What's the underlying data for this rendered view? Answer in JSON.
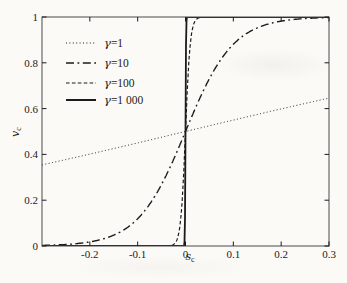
{
  "figure": {
    "background": "#fbfaf7",
    "ink": "#1b1b1b",
    "frame_color": "#4a4a4a"
  },
  "chart_data": {
    "type": "line",
    "title": "",
    "xlabel": "s_c",
    "ylabel": "v_c",
    "xlim": [
      -0.3,
      0.3
    ],
    "ylim": [
      0,
      1
    ],
    "x_ticks": [
      -0.2,
      -0.1,
      0,
      0.1,
      0.2,
      0.3
    ],
    "x_tick_labels": [
      "-0.2",
      "-0.1",
      "0",
      "0.1",
      "0.2",
      "0.3"
    ],
    "y_ticks": [
      0,
      0.2,
      0.4,
      0.6,
      0.8,
      1
    ],
    "y_tick_labels": [
      "0",
      "0.2",
      "0.4",
      "0.6",
      "0.8",
      "1"
    ],
    "grid": false,
    "legend": {
      "position": "upper-left-inside",
      "border": false
    },
    "function": "v_c = 1 / (1 + exp(-2 * gamma * s_c))",
    "series": [
      {
        "name": "γ=1",
        "symbol": "γ",
        "value_label": "=1",
        "gamma": 1,
        "style": "dotted",
        "color": "#1b1b1b",
        "points": [
          [
            -0.3,
            0.354
          ],
          [
            -0.2,
            0.401
          ],
          [
            -0.1,
            0.45
          ],
          [
            0,
            0.5
          ],
          [
            0.1,
            0.55
          ],
          [
            0.2,
            0.599
          ],
          [
            0.3,
            0.646
          ]
        ]
      },
      {
        "name": "γ=10",
        "symbol": "γ",
        "value_label": "=10",
        "gamma": 10,
        "style": "dash-dot",
        "color": "#1b1b1b",
        "points": [
          [
            -0.3,
            0.002
          ],
          [
            -0.2,
            0.018
          ],
          [
            -0.15,
            0.047
          ],
          [
            -0.1,
            0.119
          ],
          [
            -0.05,
            0.269
          ],
          [
            0,
            0.5
          ],
          [
            0.05,
            0.731
          ],
          [
            0.1,
            0.881
          ],
          [
            0.15,
            0.953
          ],
          [
            0.2,
            0.982
          ],
          [
            0.25,
            0.993
          ],
          [
            0.3,
            0.998
          ]
        ]
      },
      {
        "name": "γ=100",
        "symbol": "γ",
        "value_label": "=100",
        "gamma": 100,
        "style": "dashed",
        "color": "#1b1b1b",
        "points": [
          [
            -0.3,
            0
          ],
          [
            -0.03,
            0.002
          ],
          [
            -0.02,
            0.018
          ],
          [
            -0.01,
            0.119
          ],
          [
            0,
            0.5
          ],
          [
            0.01,
            0.881
          ],
          [
            0.02,
            0.982
          ],
          [
            0.03,
            0.998
          ],
          [
            0.3,
            1
          ]
        ]
      },
      {
        "name": "γ=1 000",
        "symbol": "γ",
        "value_label": "=1 000",
        "gamma": 1000,
        "style": "solid",
        "color": "#1b1b1b",
        "points": [
          [
            -0.3,
            0
          ],
          [
            -0.003,
            0.002
          ],
          [
            -0.001,
            0.119
          ],
          [
            0,
            0.5
          ],
          [
            0.001,
            0.881
          ],
          [
            0.003,
            0.998
          ],
          [
            0.3,
            1
          ]
        ]
      }
    ]
  }
}
